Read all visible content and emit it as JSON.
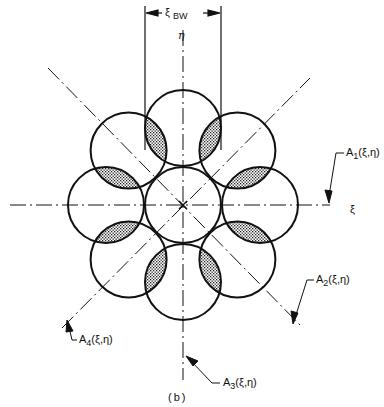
{
  "figure": {
    "caption": "(b)",
    "width_label": {
      "symbol": "ξ",
      "subscript": "BW"
    },
    "axes": {
      "vertical": "η",
      "horizontal": "ξ"
    },
    "callouts": [
      {
        "id": "A1",
        "letter": "A",
        "index": "1",
        "args": "(ξ,η)"
      },
      {
        "id": "A2",
        "letter": "A",
        "index": "2",
        "args": "(ξ,η)"
      },
      {
        "id": "A3",
        "letter": "A",
        "index": "3",
        "args": "(ξ,η)"
      },
      {
        "id": "A4",
        "letter": "A",
        "index": "4",
        "args": "(ξ,η)"
      }
    ],
    "geometry": {
      "center": [
        183,
        205
      ],
      "circle_radius": 38,
      "ring_distance": 77,
      "outer_circle_count": 8
    },
    "colors": {
      "ink": "#111111",
      "background": "#ffffff"
    }
  }
}
